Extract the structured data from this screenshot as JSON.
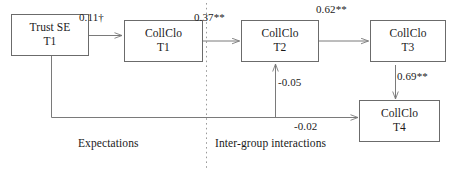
{
  "diagram": {
    "type": "path-model",
    "nodes": [
      {
        "id": "trust_se_t1",
        "line1": "Trust SE",
        "line2": "T1"
      },
      {
        "id": "collclo_t1",
        "line1": "CollClo",
        "line2": "T1"
      },
      {
        "id": "collclo_t2",
        "line1": "CollClo",
        "line2": "T2"
      },
      {
        "id": "collclo_t3",
        "line1": "CollClo",
        "line2": "T3"
      },
      {
        "id": "collclo_t4",
        "line1": "CollClo",
        "line2": "T4"
      }
    ],
    "edges": [
      {
        "id": "e_trust_to_t1",
        "from": "trust_se_t1",
        "to": "collclo_t1",
        "coefficient": "0.11†"
      },
      {
        "id": "e_t1_to_t2",
        "from": "collclo_t1",
        "to": "collclo_t2",
        "coefficient": "0.37**"
      },
      {
        "id": "e_t2_to_t3",
        "from": "collclo_t2",
        "to": "collclo_t3",
        "coefficient": "0.62**"
      },
      {
        "id": "e_t3_to_t4",
        "from": "collclo_t3",
        "to": "collclo_t4",
        "coefficient": "0.69**"
      },
      {
        "id": "e_trust_to_t2",
        "from": "trust_se_t1",
        "to": "collclo_t2",
        "coefficient": "-0.05"
      },
      {
        "id": "e_trust_to_t4",
        "from": "trust_se_t1",
        "to": "collclo_t4",
        "coefficient": "-0.02"
      }
    ],
    "sections": [
      {
        "id": "expectations",
        "label": "Expectations"
      },
      {
        "id": "intergroup",
        "label": "Inter-group interactions"
      }
    ],
    "colors": {
      "box_border": "#6b6b6b",
      "edge_stroke": "#7a7a7a",
      "divider_stroke": "#9a9a9a",
      "text": "#1a1a1a",
      "background": "#ffffff"
    }
  }
}
